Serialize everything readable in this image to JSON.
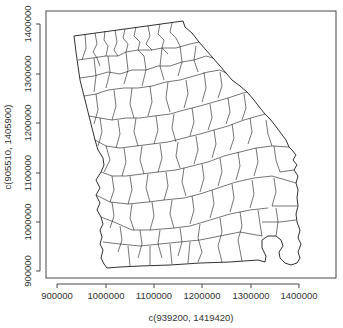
{
  "chart_data": {
    "type": "map",
    "title": "",
    "xlabel": "c(939200, 1419420)",
    "ylabel": "c(905510, 1405900)",
    "xlim": [
      939200,
      1419420
    ],
    "ylim": [
      905510,
      1405900
    ],
    "x_ticks": [
      900000,
      1000000,
      1100000,
      1200000,
      1300000,
      1400000
    ],
    "y_ticks": [
      900000,
      1000000,
      1100000,
      1200000,
      1300000,
      1400000
    ],
    "x_tick_labels": [
      "900000",
      "1000000",
      "1100000",
      "1200000",
      "1300000",
      "1400000"
    ],
    "y_tick_labels": [
      "900000",
      "1000000",
      "1100000",
      "1200000",
      "1300000",
      "1400000"
    ],
    "grid": false,
    "legend": null,
    "line_color": "#1a1a1a",
    "background": "#ffffff"
  },
  "layout": {
    "frame": {
      "left": 46,
      "top": 11,
      "right": 336,
      "bottom": 278
    },
    "x_tick_px": [
      57,
      106,
      154,
      202,
      251,
      299
    ],
    "y_tick_px": [
      271,
      222,
      173,
      123,
      74,
      24
    ]
  }
}
